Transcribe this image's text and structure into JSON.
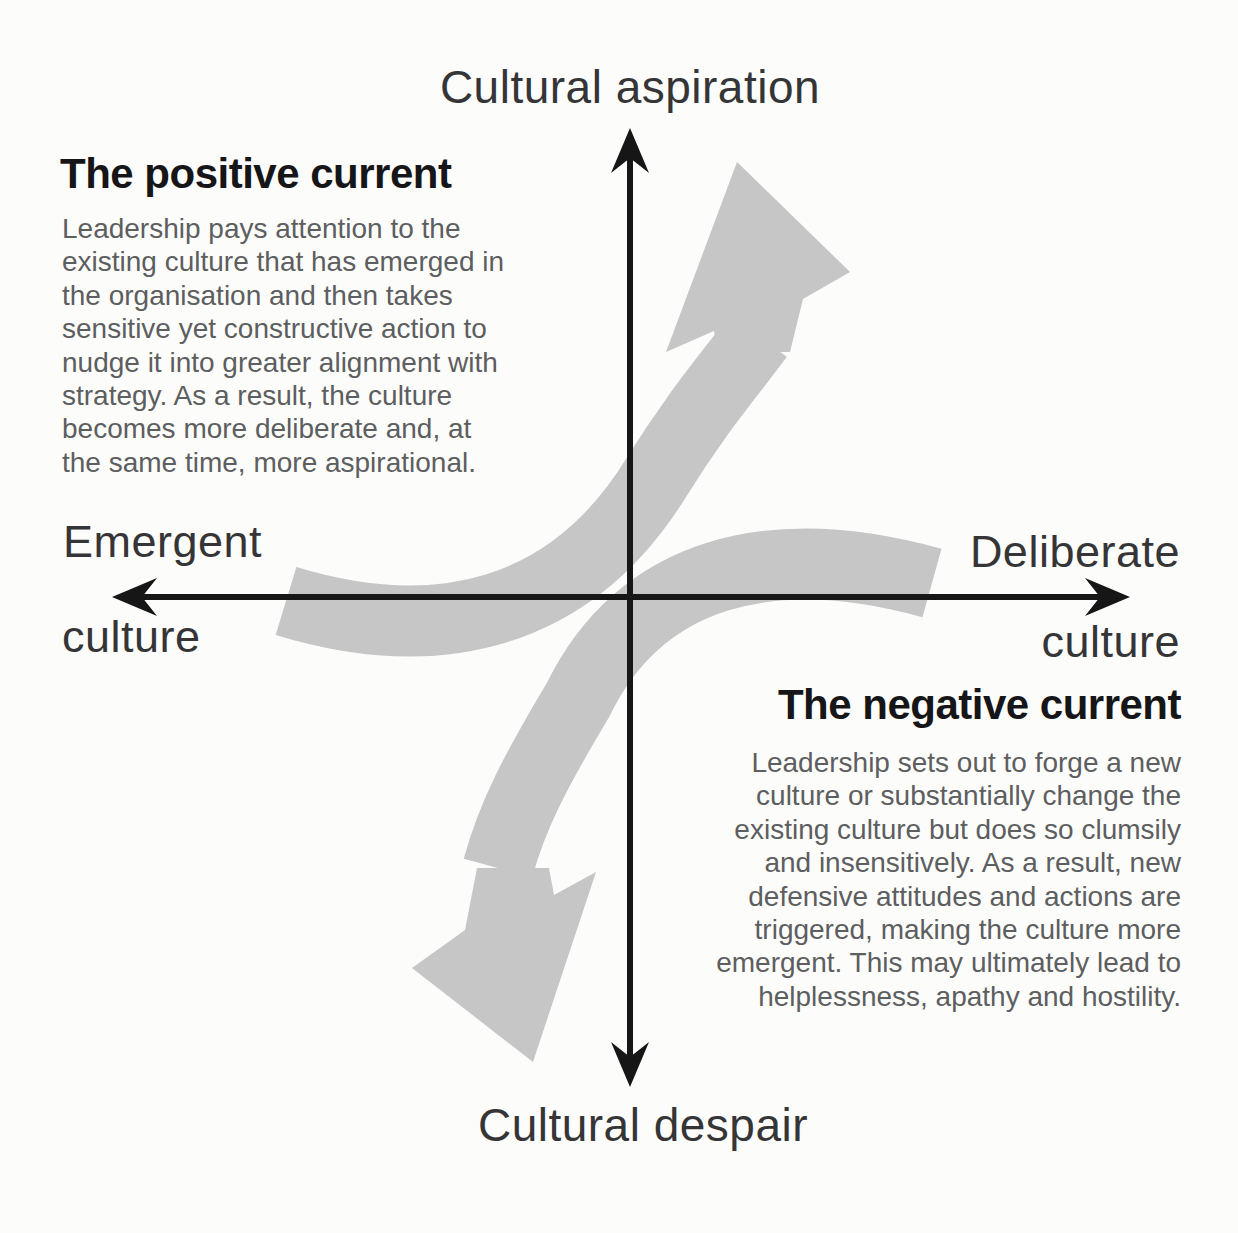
{
  "diagram": {
    "type": "quadrant-diagram",
    "colors": {
      "arrow_gray": "#c5c6c5",
      "axis_black": "#161616",
      "heading_text": "#161618",
      "body_text": "#5d5e60",
      "background": "#fcfcfb"
    },
    "icons": {
      "positive_arrow": "curved-arrow-up-right",
      "negative_arrow": "curved-arrow-down-left"
    },
    "axes": {
      "top_label": "Cultural aspiration",
      "bottom_label": "Cultural despair",
      "left_label_line1": "Emergent",
      "left_label_line2": "culture",
      "right_label_line1": "Deliberate",
      "right_label_line2": "culture"
    },
    "quadrants": {
      "positive": {
        "title": "The positive current",
        "body": "Leadership pays attention to the\nexisting culture that has emerged in\nthe organisation and then takes\nsensitive yet constructive action to\nnudge it into greater alignment with\nstrategy. As a result, the culture\nbecomes more deliberate and, at\nthe same time, more aspirational."
      },
      "negative": {
        "title": "The negative current",
        "body": "Leadership sets out to forge a new\nculture or substantially change the\nexisting culture but does so clumsily\nand insensitively. As a result, new\ndefensive attitudes and actions are\ntriggered, making the culture more\nemergent. This may ultimately lead to\nhelplessness, apathy and hostility."
      }
    }
  }
}
